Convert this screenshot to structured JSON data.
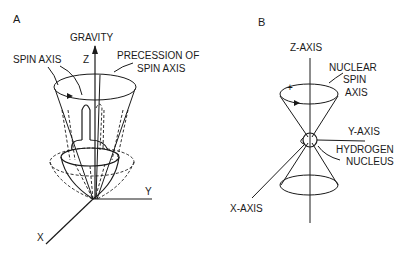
{
  "panels": [
    {
      "id": "A",
      "label": "A",
      "title": "Spinning top precessing under gravity",
      "labels": {
        "gravity": "GRAVITY",
        "z": "Z",
        "spin_axis": "SPIN AXIS",
        "precession_line1": "PRECESSION OF",
        "precession_line2": "SPIN AXIS",
        "y": "Y",
        "x": "X"
      }
    },
    {
      "id": "B",
      "label": "B",
      "title": "Hydrogen nucleus spin precession",
      "labels": {
        "z_axis": "Z-AXIS",
        "nuclear_line1": "NUCLEAR",
        "nuclear_line2": "SPIN",
        "nuclear_line3": "AXIS",
        "plus": "+",
        "y_axis": "Y-AXIS",
        "hydrogen_line1": "HYDROGEN",
        "hydrogen_line2": "NUCLEUS",
        "x_axis": "X-AXIS"
      }
    }
  ],
  "colors": {
    "ink": "#1a1a1a",
    "background": "#ffffff"
  }
}
